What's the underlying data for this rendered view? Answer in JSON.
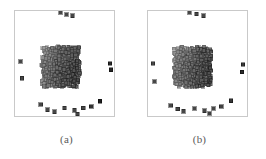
{
  "figure": {
    "type": "scatter-pair",
    "background": "#ffffff",
    "frame_color": "#c9c9c9",
    "marker_shape": "square",
    "marker_size_px": 3.2,
    "colormap": "grayscale-light-to-dark",
    "panels": [
      {
        "id": "a",
        "caption": "(a)",
        "frame": {
          "x": 14,
          "y": 10,
          "width": 101,
          "height": 107
        }
      },
      {
        "id": "b",
        "caption": "(b)",
        "frame": {
          "x": 14,
          "y": 10,
          "width": 101,
          "height": 107
        }
      }
    ]
  },
  "chart_data": {
    "type": "scatter",
    "title": "",
    "xlabel": "",
    "ylabel": "",
    "xlim": [
      0,
      1
    ],
    "ylim": [
      0,
      1
    ],
    "grid": false,
    "legend": null,
    "axis_ticks": {
      "x": [],
      "y": []
    },
    "marker": "square",
    "series": [
      {
        "name": "(a)",
        "panel": "a",
        "n_points": 900,
        "cloud": {
          "center_x": 0.46,
          "center_y": 0.47,
          "radius_x": 0.44,
          "radius_y": 0.44,
          "rotation_deg": 45,
          "shape": "rhombus"
        },
        "shade_axis": {
          "from": "upper-left",
          "to": "lower-right",
          "light": "#d8d8d8",
          "dark": "#1a1a1a"
        },
        "outliers": [
          {
            "x": 0.46,
            "y": 0.985
          },
          {
            "x": 0.52,
            "y": 0.965
          },
          {
            "x": 0.58,
            "y": 0.955
          },
          {
            "x": 0.96,
            "y": 0.5
          },
          {
            "x": 0.97,
            "y": 0.44
          },
          {
            "x": 0.055,
            "y": 0.52
          },
          {
            "x": 0.07,
            "y": 0.36
          },
          {
            "x": 0.5,
            "y": 0.075
          },
          {
            "x": 0.6,
            "y": 0.055
          },
          {
            "x": 0.69,
            "y": 0.075
          },
          {
            "x": 0.77,
            "y": 0.09
          },
          {
            "x": 0.86,
            "y": 0.14
          },
          {
            "x": 0.4,
            "y": 0.04
          },
          {
            "x": 0.33,
            "y": 0.06
          },
          {
            "x": 0.63,
            "y": 0.02
          },
          {
            "x": 0.26,
            "y": 0.11
          }
        ]
      },
      {
        "name": "(b)",
        "panel": "b",
        "n_points": 900,
        "cloud": {
          "center_x": 0.45,
          "center_y": 0.47,
          "radius_x": 0.44,
          "radius_y": 0.44,
          "rotation_deg": 45,
          "shape": "rhombus"
        },
        "shade_axis": {
          "from": "upper-left",
          "to": "lower-right",
          "light": "#d8d8d8",
          "dark": "#1a1a1a"
        },
        "outliers": [
          {
            "x": 0.42,
            "y": 0.985
          },
          {
            "x": 0.49,
            "y": 0.97
          },
          {
            "x": 0.56,
            "y": 0.955
          },
          {
            "x": 0.96,
            "y": 0.49
          },
          {
            "x": 0.95,
            "y": 0.42
          },
          {
            "x": 0.05,
            "y": 0.5
          },
          {
            "x": 0.065,
            "y": 0.33
          },
          {
            "x": 0.47,
            "y": 0.07
          },
          {
            "x": 0.57,
            "y": 0.05
          },
          {
            "x": 0.66,
            "y": 0.07
          },
          {
            "x": 0.74,
            "y": 0.09
          },
          {
            "x": 0.84,
            "y": 0.145
          },
          {
            "x": 0.36,
            "y": 0.045
          },
          {
            "x": 0.3,
            "y": 0.065
          },
          {
            "x": 0.62,
            "y": 0.025
          },
          {
            "x": 0.23,
            "y": 0.1
          }
        ]
      }
    ]
  }
}
